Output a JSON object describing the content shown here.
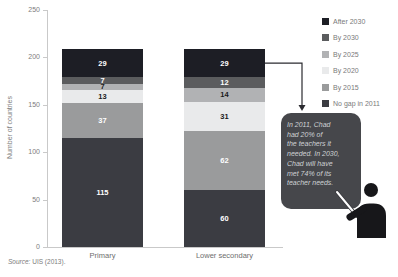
{
  "chart_data": {
    "type": "bar",
    "stacked": true,
    "categories": [
      "Primary",
      "Lower secondary"
    ],
    "series": [
      {
        "name": "No gap in 2011",
        "color": "#3b3c42",
        "label_color": "#ffffff",
        "values": [
          115,
          60
        ]
      },
      {
        "name": "By 2015",
        "color": "#9a9b9c",
        "label_color": "#ffffff",
        "values": [
          37,
          62
        ]
      },
      {
        "name": "By 2020",
        "color": "#e9eaeb",
        "label_color": "#1a1a1a",
        "values": [
          13,
          31
        ]
      },
      {
        "name": "By 2025",
        "color": "#b1b2b4",
        "label_color": "#1a1a1a",
        "values": [
          7,
          14
        ]
      },
      {
        "name": "By 2030",
        "color": "#5b5c5e",
        "label_color": "#ffffff",
        "values": [
          7,
          12
        ]
      },
      {
        "name": "After 2030",
        "color": "#1d1e25",
        "label_color": "#ffffff",
        "values": [
          29,
          29
        ]
      }
    ],
    "totals": [
      208,
      208
    ],
    "ylabel": "Number of countries",
    "ylim": [
      0,
      250
    ],
    "yticks": [
      0,
      50,
      100,
      150,
      200,
      250
    ],
    "grid": false,
    "legend_position": "top-right",
    "legend_order": [
      "After 2030",
      "By 2030",
      "By 2025",
      "By 2020",
      "By 2015",
      "No gap in 2011"
    ]
  },
  "annotation": {
    "full_text": "In 2011, Chad had 20% of the teachers it needed. In 2030, Chad will have met 74% of its teacher needs.",
    "lines": [
      "In 2011, Chad",
      "had 20% of",
      "the teachers it",
      "needed. In 2030,",
      "Chad will have",
      "met 74% of its",
      "teacher needs."
    ],
    "board_color": "#46474b",
    "text_color": "#ced2d5",
    "icon": "teacher-presenter-icon"
  },
  "palette": {
    "axis": "#c9c9c9",
    "tick_text": "#7d7d7d",
    "category_text": "#6e6e6e",
    "legend_text": "#7a7a7a",
    "arrow": "#2b2b30",
    "person": "#17171a",
    "pointer_stick": "#ffffff"
  },
  "source": {
    "label": "Source:",
    "text": "UIS (2013)."
  }
}
